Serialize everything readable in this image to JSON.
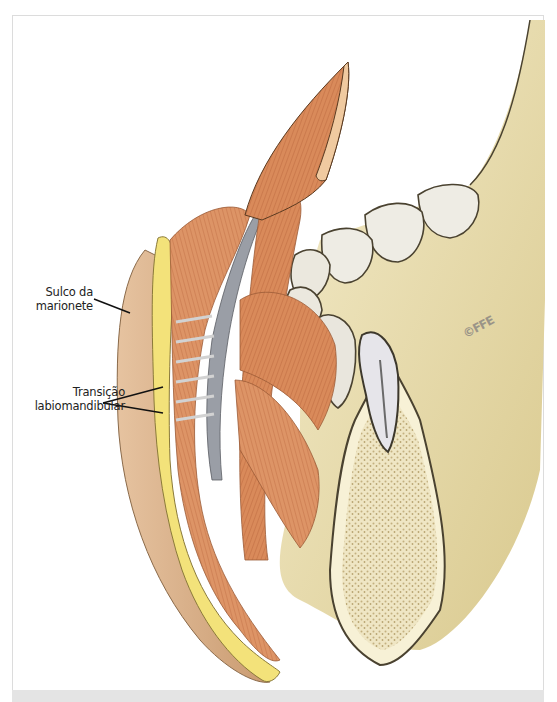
{
  "figure": {
    "type": "anatomical illustration",
    "labels": [
      {
        "id": "sulco",
        "lines": [
          "Sulco da",
          "marionete"
        ]
      },
      {
        "id": "transicao",
        "lines": [
          "Transição",
          "labiomandibular"
        ]
      }
    ],
    "copyright": "©FFE",
    "colors": {
      "muscle": "#d98a5a",
      "muscle_dark": "#b8623a",
      "fat": "#f3e27a",
      "skin": "#d9b08a",
      "bone": "#ece3b8",
      "cancellous": "#cbb98a",
      "tooth": "#eeece4",
      "outline": "#4a4230",
      "ligament": "#c8c8c8",
      "fascia": "#8c8f96",
      "bottom_strip": "#e4e4e4"
    }
  }
}
